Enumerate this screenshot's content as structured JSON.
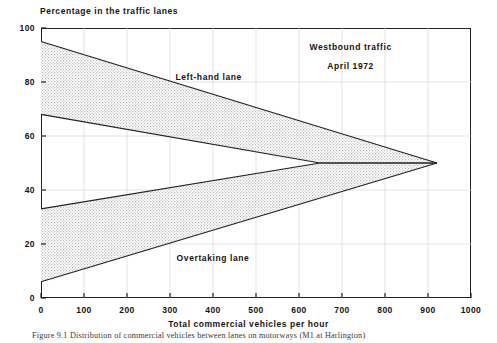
{
  "chart_data": {
    "type": "area",
    "title": "",
    "ylabel": "Percentage in the traffic lanes",
    "xlabel": "Total commercial vehicles per hour",
    "xlim": [
      0,
      1000
    ],
    "ylim": [
      0,
      100
    ],
    "xticks": [
      "0",
      "100",
      "200",
      "300",
      "400",
      "500",
      "600",
      "700",
      "800",
      "900",
      "1000"
    ],
    "yticks": [
      "0",
      "20",
      "40",
      "60",
      "80",
      "100"
    ],
    "grid": true,
    "legend_position": "none",
    "annotations": [
      {
        "text": "Westbound traffic",
        "x": 720,
        "y": 93
      },
      {
        "text": "April 1972",
        "x": 720,
        "y": 86
      },
      {
        "text": "Left-hand lane",
        "x": 390,
        "y": 82
      },
      {
        "text": "Overtaking lane",
        "x": 400,
        "y": 15
      }
    ],
    "bands": [
      {
        "name": "Left-hand lane",
        "upper": [
          {
            "x": 0,
            "y": 95
          },
          {
            "x": 921,
            "y": 50
          }
        ],
        "lower": [
          {
            "x": 0,
            "y": 68
          },
          {
            "x": 649,
            "y": 50
          },
          {
            "x": 921,
            "y": 50
          }
        ]
      },
      {
        "name": "Overtaking lane",
        "upper": [
          {
            "x": 0,
            "y": 33
          },
          {
            "x": 649,
            "y": 50
          },
          {
            "x": 921,
            "y": 50
          }
        ],
        "lower": [
          {
            "x": 0,
            "y": 6
          },
          {
            "x": 921,
            "y": 50
          }
        ]
      }
    ],
    "series": [
      {
        "name": "left-hand-lane-upper",
        "points": [
          {
            "x": 0,
            "y": 95
          },
          {
            "x": 921,
            "y": 50
          }
        ]
      },
      {
        "name": "left-hand-lane-lower",
        "points": [
          {
            "x": 0,
            "y": 68
          },
          {
            "x": 649,
            "y": 50
          },
          {
            "x": 921,
            "y": 50
          }
        ]
      },
      {
        "name": "overtaking-lane-upper",
        "points": [
          {
            "x": 0,
            "y": 33
          },
          {
            "x": 649,
            "y": 50
          },
          {
            "x": 921,
            "y": 50
          }
        ]
      },
      {
        "name": "overtaking-lane-lower",
        "points": [
          {
            "x": 0,
            "y": 6
          },
          {
            "x": 921,
            "y": 50
          }
        ]
      }
    ],
    "colors": {
      "line": "#222222",
      "fill": "#d6d6d6",
      "grid": "#dcdcdc",
      "axis": "#222222"
    }
  },
  "caption": {
    "text": "Figure 9.1  Distribution of commercial vehicles between lanes on motorways (M1 at Harlington)"
  }
}
